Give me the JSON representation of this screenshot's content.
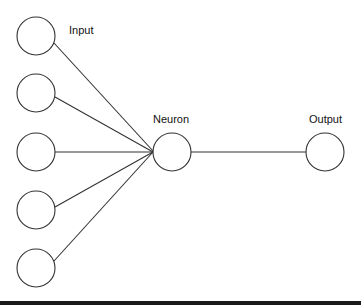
{
  "diagram": {
    "type": "perceptron",
    "labels": {
      "input": "Input",
      "neuron": "Neuron",
      "output": "Output"
    },
    "stroke_color": "#333333",
    "input_nodes": [
      {
        "cx": 36,
        "cy": 36
      },
      {
        "cx": 36,
        "cy": 93
      },
      {
        "cx": 36,
        "cy": 152
      },
      {
        "cx": 36,
        "cy": 210
      },
      {
        "cx": 36,
        "cy": 268
      }
    ],
    "neuron_node": {
      "cx": 172,
      "cy": 152
    },
    "output_node": {
      "cx": 325,
      "cy": 152
    },
    "node_radius": 19
  }
}
